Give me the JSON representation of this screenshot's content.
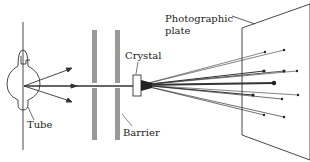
{
  "labels": {
    "tube": "Tube",
    "barrier": "Barrier",
    "crystal": "Crystal",
    "plate_line1": "Photographic",
    "plate_line2": "plate"
  },
  "colors": {
    "line": "#333333",
    "barrier": "#999999",
    "background": "#ffffff"
  },
  "spots": [
    {
      "x": 265,
      "y": 52
    },
    {
      "x": 284,
      "y": 50
    },
    {
      "x": 264,
      "y": 71
    },
    {
      "x": 284,
      "y": 71
    },
    {
      "x": 297,
      "y": 71
    },
    {
      "x": 274,
      "y": 83
    },
    {
      "x": 253,
      "y": 95
    },
    {
      "x": 282,
      "y": 99
    },
    {
      "x": 298,
      "y": 95
    },
    {
      "x": 264,
      "y": 115
    },
    {
      "x": 284,
      "y": 117
    }
  ]
}
